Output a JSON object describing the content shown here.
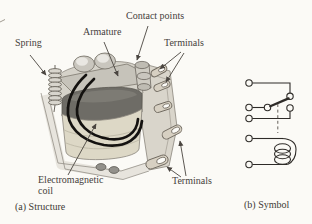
{
  "colors": {
    "background": "#fbfaf6",
    "ink": "#46413c",
    "schematic_line": "#2e2b28",
    "coil_wire": "#141210"
  },
  "figure": {
    "panel_a": {
      "caption": "(a) Structure",
      "labels": {
        "spring": "Spring",
        "armature": "Armature",
        "contact_points": "Contact points",
        "terminals_top": "Terminals",
        "electromagnetic_coil": "Electromagnetic coil",
        "terminals_bottom": "Terminals"
      }
    },
    "panel_b": {
      "caption": "(b) Symbol",
      "schematic": {
        "type": "relay symbol",
        "left_terminals": 5,
        "contacts": [
          "normally-closed",
          "normally-open"
        ],
        "has_coil": true,
        "has_dashed_actuation_link": true
      }
    }
  }
}
